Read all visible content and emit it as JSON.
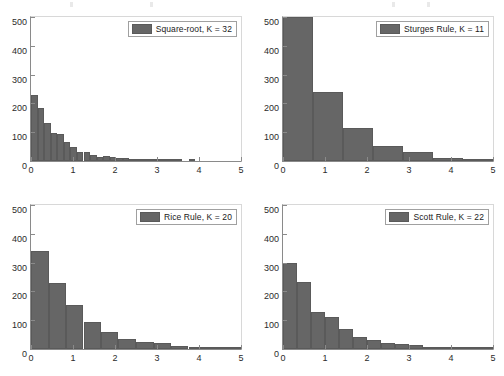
{
  "figure": {
    "background": "#ffffff",
    "bar_color": "#666666",
    "axis_color": "#8a8a8a",
    "panel_count": 4
  },
  "chart_data": [
    {
      "type": "bar",
      "title": "",
      "legend_label": "Square-root, K =  32",
      "legend_position": "top-right",
      "xlabel": "",
      "ylabel": "",
      "xlim": [
        0,
        5
      ],
      "ylim": [
        0,
        500
      ],
      "xticks": [
        "0",
        "1",
        "2",
        "3",
        "4",
        "5"
      ],
      "xtick_values": [
        0,
        1,
        2,
        3,
        4,
        5
      ],
      "yticks": [
        "0",
        "100",
        "200",
        "300",
        "400",
        "500"
      ],
      "ytick_values": [
        0,
        100,
        200,
        300,
        400,
        500
      ],
      "grid": false,
      "bin_edges": [
        0.0,
        0.1563,
        0.3125,
        0.4688,
        0.625,
        0.7813,
        0.9375,
        1.0938,
        1.25,
        1.4063,
        1.5625,
        1.7188,
        1.875,
        2.0313,
        2.1875,
        2.3438,
        2.5,
        2.6563,
        2.8125,
        2.9688,
        3.125,
        3.2813,
        3.4375,
        3.5938,
        3.75,
        3.9063,
        4.0625,
        4.2188,
        4.375,
        4.5313,
        4.6875,
        4.8438,
        5.0
      ],
      "values": [
        228,
        185,
        133,
        97,
        94,
        65,
        47,
        33,
        30,
        21,
        13,
        16,
        14,
        12,
        9,
        4,
        3,
        7,
        4,
        2,
        1,
        1,
        1,
        0,
        1,
        0,
        0,
        0,
        0,
        0,
        0,
        0
      ]
    },
    {
      "type": "bar",
      "title": "",
      "legend_label": "Sturges Rule, K =  11",
      "legend_position": "top-right",
      "xlabel": "",
      "ylabel": "",
      "xlim": [
        0,
        5
      ],
      "ylim": [
        0,
        500
      ],
      "xticks": [
        "0",
        "1",
        "2",
        "3",
        "4",
        "5"
      ],
      "xtick_values": [
        0,
        1,
        2,
        3,
        4,
        5
      ],
      "yticks": [
        "0",
        "100",
        "200",
        "300",
        "400",
        "500"
      ],
      "ytick_values": [
        0,
        100,
        200,
        300,
        400,
        500
      ],
      "grid": false,
      "bin_edges": [
        0.0,
        0.7143,
        1.4286,
        2.1429,
        2.8571,
        3.5714,
        4.2857,
        5.0
      ],
      "values": [
        500,
        239,
        113,
        51,
        31,
        10,
        3
      ]
    },
    {
      "type": "bar",
      "title": "",
      "legend_label": "Rice Rule, K =  20",
      "legend_position": "top-right",
      "xlabel": "",
      "ylabel": "",
      "xlim": [
        0,
        5
      ],
      "ylim": [
        0,
        500
      ],
      "xticks": [
        "0",
        "1",
        "2",
        "3",
        "4",
        "5"
      ],
      "xtick_values": [
        0,
        1,
        2,
        3,
        4,
        5
      ],
      "yticks": [
        "0",
        "100",
        "200",
        "300",
        "400",
        "500"
      ],
      "ytick_values": [
        0,
        100,
        200,
        300,
        400,
        500
      ],
      "grid": false,
      "bin_edges": [
        0.0,
        0.4167,
        0.8333,
        1.25,
        1.6667,
        2.0833,
        2.5,
        2.9167,
        3.3333,
        3.75,
        4.1667,
        4.5833,
        5.0
      ],
      "values": [
        340,
        229,
        154,
        94,
        58,
        35,
        26,
        22,
        10,
        7,
        3,
        2
      ]
    },
    {
      "type": "bar",
      "title": "",
      "legend_label": "Scott Rule, K =  22",
      "legend_position": "top-right",
      "xlabel": "",
      "ylabel": "",
      "xlim": [
        0,
        5
      ],
      "ylim": [
        0,
        500
      ],
      "xticks": [
        "0",
        "1",
        "2",
        "3",
        "4",
        "5"
      ],
      "xtick_values": [
        0,
        1,
        2,
        3,
        4,
        5
      ],
      "yticks": [
        "0",
        "100",
        "200",
        "300",
        "400",
        "500"
      ],
      "ytick_values": [
        0,
        100,
        200,
        300,
        400,
        500
      ],
      "grid": false,
      "bin_edges": [
        0.0,
        0.3333,
        0.6667,
        1.0,
        1.3333,
        1.6667,
        2.0,
        2.3333,
        2.6667,
        3.0,
        3.3333,
        3.6667,
        4.0,
        4.3333,
        4.6667,
        5.0
      ],
      "values": [
        299,
        232,
        127,
        110,
        69,
        43,
        30,
        21,
        19,
        14,
        4,
        8,
        2,
        1,
        1
      ]
    }
  ]
}
